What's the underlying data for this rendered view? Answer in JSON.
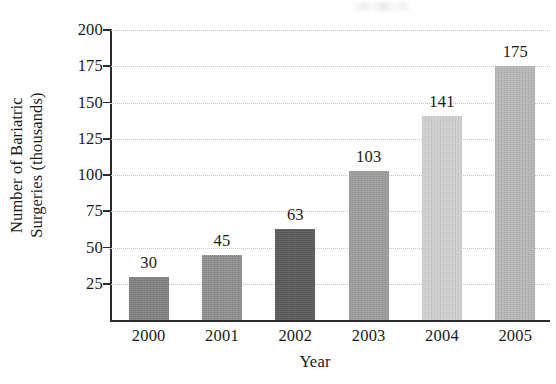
{
  "chart_data": {
    "type": "bar",
    "title": "",
    "subtitle": "",
    "xlabel": "Year",
    "ylabel": "Number of Bariatric Surgeries (thousands)",
    "ylabel_line1": "Number of Bariatric",
    "ylabel_line2": "Surgeries (thousands)",
    "categories": [
      "2000",
      "2001",
      "2002",
      "2003",
      "2004",
      "2005"
    ],
    "values": [
      30,
      45,
      63,
      103,
      141,
      175
    ],
    "data_labels": [
      "30",
      "45",
      "63",
      "103",
      "141",
      "175"
    ],
    "ylim": [
      0,
      200
    ],
    "ytick_values": [
      25,
      50,
      75,
      100,
      125,
      150,
      175,
      200
    ],
    "ytick_labels": [
      "25",
      "50",
      "75",
      "100",
      "125",
      "150",
      "175",
      "200"
    ],
    "grid": true,
    "grid_style": "dotted",
    "grid_color": "#c9c9c9",
    "legend": false,
    "legend_position": "none",
    "axis_color": "#2b2b2b",
    "bar_colors": [
      "#808080",
      "#8f8f8f",
      "#595959",
      "#9c9c9c",
      "#cfcfcf",
      "#b6b6b6"
    ],
    "bars": [
      {
        "category": "2000",
        "value": 30,
        "label": "30",
        "color": "#808080"
      },
      {
        "category": "2001",
        "value": 45,
        "label": "45",
        "color": "#8f8f8f"
      },
      {
        "category": "2002",
        "value": 63,
        "label": "63",
        "color": "#595959"
      },
      {
        "category": "2003",
        "value": 103,
        "label": "103",
        "color": "#9c9c9c"
      },
      {
        "category": "2004",
        "value": 141,
        "label": "141",
        "color": "#cfcfcf"
      },
      {
        "category": "2005",
        "value": 175,
        "label": "175",
        "color": "#b6b6b6"
      }
    ]
  }
}
